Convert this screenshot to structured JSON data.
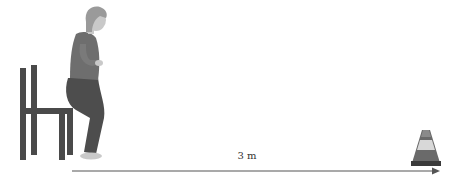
{
  "diagram": {
    "distance_label": "3 m",
    "elements": [
      {
        "name": "chair",
        "description": "side view of a straight-backed chair"
      },
      {
        "name": "person",
        "description": "woman rising from the chair in a squat / standing-up posture"
      },
      {
        "name": "distance-arrow",
        "description": "horizontal arrow from chair to cone"
      },
      {
        "name": "traffic-cone",
        "description": "cone marker at the 3 m point"
      }
    ]
  },
  "colors": {
    "chair": "#4a4a4a",
    "pants": "#4d4d4d",
    "shirt": "#6e6e6e",
    "skin": "#c9c9c9",
    "hair": "#9a9a9a",
    "arrow": "#555555",
    "cone_dark": "#555555",
    "cone_light": "#d8d8d8",
    "cone_base": "#3a3a3a"
  }
}
